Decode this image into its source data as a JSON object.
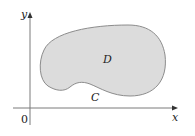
{
  "diagram": {
    "type": "planar-region",
    "axes": {
      "x_label": "x",
      "y_label": "y",
      "origin_label": "0"
    },
    "region": {
      "label": "D",
      "fill_color": "#dcdcdc",
      "stroke_color": "#8c8c8c"
    },
    "boundary_curve": {
      "label": "C"
    },
    "axis_color": "#7a7a7a"
  }
}
